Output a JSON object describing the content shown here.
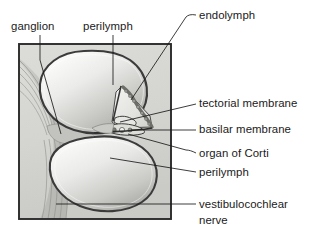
{
  "figure": {
    "width": 329,
    "height": 239,
    "background_color": "#ffffff"
  },
  "colors": {
    "page_background": "#ffffff",
    "frame_stroke": "#2b2b2b",
    "panel_fill": "#d6d6d2",
    "bone_fill": "#cfcfcb",
    "scala_outline": "#383838",
    "scala_fill_light": "#f2f2f0",
    "scala_fill_mid": "#c8c8c5",
    "scala_fill_dark": "#a8a8a4",
    "membrane_stroke": "#3a3a3a",
    "duct_fill": "#e8e8e6",
    "stria_fill": "#8f8f8c",
    "nerve_fill": "#c0c0bc",
    "text_color": "#1a1a1a",
    "leader_stroke": "#1a1a1a"
  },
  "labels_top": [
    {
      "id": "ganglion",
      "text": "ganglion",
      "x": 11,
      "y": 30,
      "anchor": "start"
    },
    {
      "id": "perilymph-top",
      "text": "perilymph",
      "x": 83,
      "y": 30,
      "anchor": "start"
    }
  ],
  "labels_right": [
    {
      "id": "endolymph",
      "text": "endolymph",
      "x": 199,
      "y": 19,
      "anchor": "start"
    },
    {
      "id": "tectorial-membrane",
      "text": "tectorial membrane",
      "x": 199,
      "y": 107,
      "anchor": "start"
    },
    {
      "id": "basilar-membrane",
      "text": "basilar membrane",
      "x": 199,
      "y": 133,
      "anchor": "start"
    },
    {
      "id": "organ-of-corti",
      "text": "organ of Corti",
      "x": 199,
      "y": 157,
      "anchor": "start"
    },
    {
      "id": "perilymph-right",
      "text": "perilymph",
      "x": 199,
      "y": 176,
      "anchor": "start"
    },
    {
      "id": "vestibulocochlear-nerve-line1",
      "text": "vestibulocochlear",
      "x": 199,
      "y": 208,
      "anchor": "start"
    },
    {
      "id": "vestibulocochlear-nerve-line2",
      "text": "nerve",
      "x": 199,
      "y": 224,
      "anchor": "start"
    }
  ],
  "leader_lines": [
    {
      "id": "leader-ganglion",
      "d": "M 40 35 L 40 60 L 61 134"
    },
    {
      "id": "leader-perilymph-top",
      "d": "M 113 35 L 113 85"
    },
    {
      "id": "leader-endolymph",
      "d": "M 196 15 L 186 17 L 131 100"
    },
    {
      "id": "leader-tectorial-membrane",
      "d": "M 196 104 L 120 122"
    },
    {
      "id": "leader-basilar-membrane",
      "d": "M 196 130 L 131 130"
    },
    {
      "id": "leader-organ-of-corti",
      "d": "M 196 153 L 188 150 L 128 133"
    },
    {
      "id": "leader-perilymph-right",
      "d": "M 196 172 L 110 158"
    },
    {
      "id": "leader-vestibulocochlear-nerve",
      "d": "M 196 204 L 56 204"
    }
  ],
  "anatomy_parts": [
    {
      "id": "frame",
      "name": "specimen-frame",
      "description": "square bone frame enclosing the section"
    },
    {
      "id": "scala-vestibuli",
      "name": "scala-vestibuli",
      "description": "upper perilymph-filled oval chamber"
    },
    {
      "id": "scala-tympani",
      "name": "scala-tympani",
      "description": "lower perilymph-filled oval chamber"
    },
    {
      "id": "cochlear-duct",
      "name": "cochlear-duct",
      "description": "triangular endolymph-filled scala media"
    },
    {
      "id": "stria-vascularis",
      "name": "stria-vascularis",
      "description": "bumpy lateral wall of the cochlear duct"
    },
    {
      "id": "tectorial-membrane",
      "name": "tectorial-membrane",
      "description": "flap overhanging the organ of Corti"
    },
    {
      "id": "basilar-membrane",
      "name": "basilar-membrane",
      "description": "floor of the cochlear duct"
    },
    {
      "id": "organ-of-corti",
      "name": "organ-of-corti",
      "description": "hair-cell cluster on the basilar membrane"
    },
    {
      "id": "spiral-ganglion",
      "name": "spiral-ganglion",
      "description": "nerve cell body cluster at the modiolus"
    },
    {
      "id": "cochlear-nerve",
      "name": "cochlear-nerve-fibers",
      "description": "fanned nerve fiber bundles on the left"
    }
  ]
}
